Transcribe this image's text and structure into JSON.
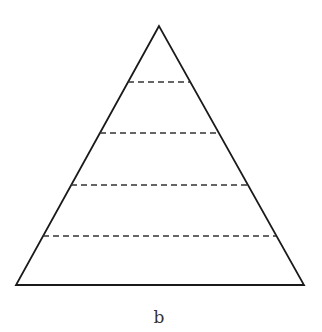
{
  "figure": {
    "label": "b",
    "colors": {
      "outline": "#1a1a1a",
      "dashed": "#333333",
      "background": "#ffffff"
    },
    "triangle": {
      "apex": [
        159,
        26
      ],
      "base_left": [
        16,
        285
      ],
      "base_right": [
        304,
        285
      ]
    },
    "dashed_lines": [
      {
        "y": 82,
        "x1": 128,
        "x2": 190
      },
      {
        "y": 133,
        "x1": 100,
        "x2": 219
      },
      {
        "y": 185,
        "x1": 71,
        "x2": 248
      },
      {
        "y": 236,
        "x1": 43,
        "x2": 276
      }
    ]
  }
}
